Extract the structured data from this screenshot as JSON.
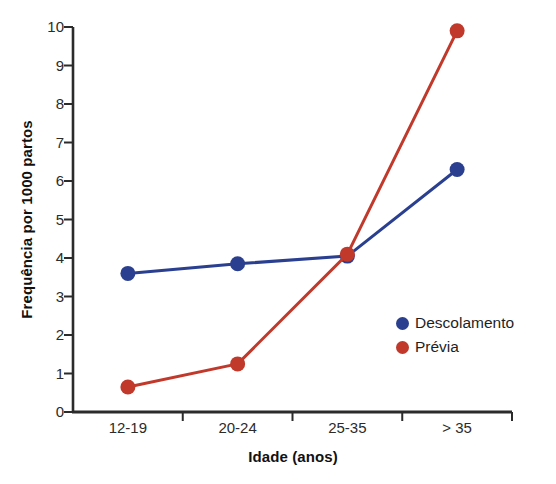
{
  "chart_data": {
    "type": "line",
    "title": "",
    "xlabel": "Idade (anos)",
    "ylabel": "Frequência por 1000 partos",
    "categories": [
      "12-19",
      "20-24",
      "25-35",
      "> 35"
    ],
    "series": [
      {
        "name": "Descolamento",
        "color": "#2a3f8f",
        "values": [
          3.6,
          3.85,
          4.05,
          6.3
        ]
      },
      {
        "name": "Prévia",
        "color": "#c0392b",
        "values": [
          0.65,
          1.25,
          4.1,
          9.9
        ]
      }
    ],
    "ylim": [
      0,
      10
    ],
    "yticks": [
      "0",
      "1",
      "2",
      "3",
      "4",
      "5",
      "6",
      "7",
      "8",
      "9",
      "10"
    ],
    "grid": false,
    "legend_position": "inside-right"
  },
  "legend": {
    "entries": [
      {
        "label": "Descolamento",
        "color": "#2a3f8f"
      },
      {
        "label": "Prévia",
        "color": "#c0392b"
      }
    ]
  },
  "axes": {
    "x_title": "Idade (anos)",
    "y_title": "Frequência por 1000 partos"
  }
}
